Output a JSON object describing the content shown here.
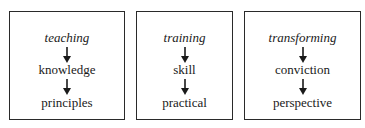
{
  "diagram": {
    "columns": [
      {
        "title": "teaching",
        "steps": [
          "knowledge",
          "principles"
        ]
      },
      {
        "title": "training",
        "steps": [
          "skill",
          "practical"
        ]
      },
      {
        "title": "transforming",
        "steps": [
          "conviction",
          "perspective"
        ]
      }
    ],
    "arrow_icon": "down-arrow-icon",
    "border_color": "#2a2a2a",
    "text_color": "#1a1a1a"
  }
}
